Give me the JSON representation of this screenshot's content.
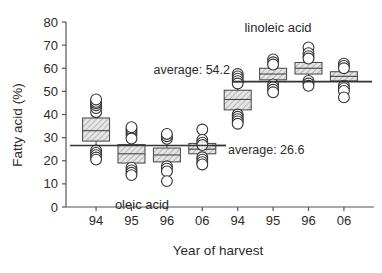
{
  "chart_data": {
    "type": "box",
    "title": "",
    "xlabel": "Year of harvest",
    "ylabel": "Fatty acid (%)",
    "ylim": [
      0,
      80
    ],
    "yticks": [
      0,
      10,
      20,
      30,
      40,
      50,
      60,
      70,
      80
    ],
    "grid": false,
    "legend_position": "none",
    "categories": [
      "94",
      "95",
      "96",
      "06",
      "94",
      "95",
      "96",
      "06"
    ],
    "group_labels": [
      "oleic acid",
      "linoleic acid"
    ],
    "annotations": [
      {
        "text": "average: 54.2",
        "value": 54.2,
        "series": "linoleic acid"
      },
      {
        "text": "average: 26.6",
        "value": 26.6,
        "series": "oleic acid"
      }
    ],
    "series": [
      {
        "name": "oleic acid",
        "average": 26.6,
        "boxes": [
          {
            "category": "94",
            "q1": 28.5,
            "median": 33.0,
            "q3": 38.5,
            "points": [
              41.0,
              42.8,
              44.0,
              44.8,
              45.5,
              46.5,
              24.5,
              23.4,
              22.4,
              21.4,
              20.5
            ]
          },
          {
            "category": "95",
            "q1": 19.0,
            "median": 23.0,
            "q3": 27.0,
            "points": [
              31.2,
              32.4,
              33.5,
              34.5,
              29.6,
              17.0,
              15.8,
              14.8,
              13.8
            ]
          },
          {
            "category": "96",
            "q1": 19.5,
            "median": 22.5,
            "q3": 25.5,
            "points": [
              29.5,
              30.6,
              31.6,
              17.6,
              16.6,
              15.4,
              11.2
            ]
          },
          {
            "category": "06",
            "q1": 23.0,
            "median": 25.0,
            "q3": 27.5,
            "points": [
              33.5,
              29.0,
              27.8,
              26.8,
              21.5,
              20.5,
              19.4,
              18.4
            ]
          }
        ]
      },
      {
        "name": "linoleic acid",
        "average": 54.2,
        "boxes": [
          {
            "category": "94",
            "q1": 42.0,
            "median": 46.5,
            "q3": 50.5,
            "points": [
              57.5,
              56.5,
              55.5,
              54.4,
              53.4,
              40.0,
              39.0,
              38.0,
              37.0,
              36.0
            ]
          },
          {
            "category": "95",
            "q1": 55.0,
            "median": 57.5,
            "q3": 60.0,
            "points": [
              63.8,
              62.6,
              61.6,
              53.0,
              51.8,
              50.7,
              49.6
            ]
          },
          {
            "category": "96",
            "q1": 57.5,
            "median": 60.0,
            "q3": 62.5,
            "points": [
              69.0,
              66.5,
              65.2,
              64.2,
              54.5,
              53.4,
              52.4
            ]
          },
          {
            "category": "06",
            "q1": 54.5,
            "median": 56.5,
            "q3": 58.5,
            "points": [
              62.0,
              61.0,
              60.0,
              52.5,
              51.4,
              50.2,
              47.4
            ]
          }
        ]
      }
    ]
  },
  "labels": {
    "ylabel": "Fatty acid (%)",
    "xlabel": "Year of harvest",
    "group_oleic": "oleic acid",
    "group_linoleic": "linoleic acid",
    "avg_linoleic": "average: 54.2",
    "avg_oleic": "average: 26.6",
    "yticks": [
      "80",
      "70",
      "60",
      "50",
      "40",
      "30",
      "20",
      "10",
      "0"
    ],
    "xticks": [
      "94",
      "95",
      "96",
      "06",
      "94",
      "95",
      "96",
      "06"
    ]
  },
  "colors": {
    "axis": "#555555",
    "text": "#2b2b2b",
    "box_fill": "#d9d9d9",
    "box_stroke": "#444444",
    "point_stroke": "#333333",
    "avg_line": "#333333"
  }
}
